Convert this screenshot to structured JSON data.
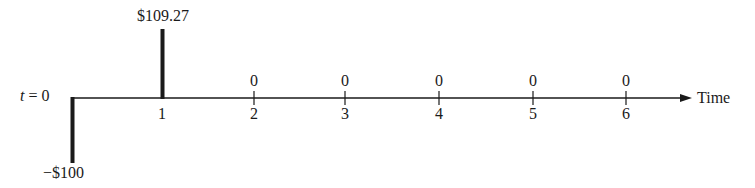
{
  "diagram": {
    "type": "cash-flow-timeline",
    "axis_label": "Time",
    "origin_label_var": "t",
    "origin_label_eq": " = 0",
    "colors": {
      "ink": "#1a1a1a",
      "background": "#ffffff"
    },
    "periods": [
      {
        "t": 1,
        "tick_label": "1",
        "value_label": "$109.27",
        "x": 162
      },
      {
        "t": 2,
        "tick_label": "2",
        "value_label": "0",
        "x": 254
      },
      {
        "t": 3,
        "tick_label": "3",
        "value_label": "0",
        "x": 345
      },
      {
        "t": 4,
        "tick_label": "4",
        "value_label": "0",
        "x": 439
      },
      {
        "t": 5,
        "tick_label": "5",
        "value_label": "0",
        "x": 533
      },
      {
        "t": 6,
        "tick_label": "6",
        "value_label": "0",
        "x": 626
      }
    ],
    "initial_flow_label": "−$100",
    "cash_flows": [
      {
        "t": 0,
        "amount": -100
      },
      {
        "t": 1,
        "amount": 109.27
      },
      {
        "t": 2,
        "amount": 0
      },
      {
        "t": 3,
        "amount": 0
      },
      {
        "t": 4,
        "amount": 0
      },
      {
        "t": 5,
        "amount": 0
      },
      {
        "t": 6,
        "amount": 0
      }
    ]
  }
}
